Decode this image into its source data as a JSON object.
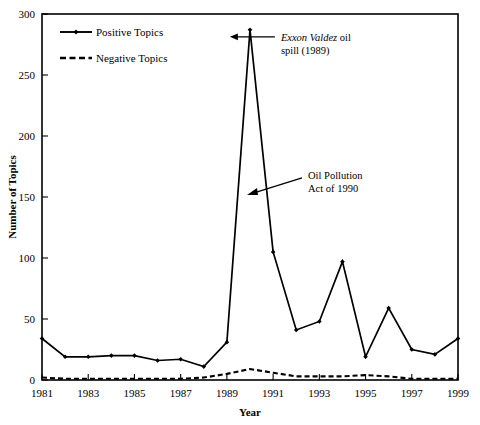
{
  "chart_data": {
    "type": "line",
    "title": "",
    "xlabel": "Year",
    "ylabel": "Number of Topics",
    "x": [
      1981,
      1982,
      1983,
      1984,
      1985,
      1986,
      1987,
      1988,
      1989,
      1990,
      1991,
      1992,
      1993,
      1994,
      1995,
      1996,
      1997,
      1998,
      1999
    ],
    "xlim": [
      1981,
      1999
    ],
    "ylim": [
      0,
      300
    ],
    "xticks": [
      1981,
      1983,
      1985,
      1987,
      1989,
      1991,
      1993,
      1995,
      1997,
      1999
    ],
    "xtick_labels": [
      "1981",
      "1983",
      "1985",
      "1987",
      "1989",
      "1991",
      "1993",
      "1995",
      "1997",
      "1999"
    ],
    "yticks": [
      0,
      50,
      100,
      150,
      200,
      250,
      300
    ],
    "ytick_labels": [
      "0",
      "50",
      "100",
      "150",
      "200",
      "250",
      "300"
    ],
    "grid": false,
    "legend_position": "top-left",
    "series": [
      {
        "name": "Positive Topics",
        "style": "solid",
        "marker": "diamond",
        "values": [
          34,
          19,
          19,
          20,
          20,
          16,
          17,
          11,
          31,
          287,
          105,
          41,
          48,
          97,
          19,
          59,
          25,
          21,
          34
        ]
      },
      {
        "name": "Negative Topics",
        "style": "dashed",
        "marker": "none",
        "values": [
          2,
          1,
          1,
          1,
          1,
          1,
          1,
          2,
          5,
          9,
          6,
          3,
          3,
          3,
          4,
          3,
          1,
          1,
          1
        ]
      }
    ],
    "annotations": [
      {
        "id": "exxon-valdez",
        "line1_italic": "Exxon Valdez",
        "line1_rest": " oil",
        "line2": "spill (1989)",
        "points_to_year": 1989,
        "points_to_value": 287
      },
      {
        "id": "oil-pollution-act",
        "line1": "Oil Pollution",
        "line2": "Act of 1990",
        "points_to_year": 1990,
        "points_to_value": 155
      }
    ]
  },
  "legend": {
    "items": [
      {
        "label": "Positive Topics",
        "style": "solid"
      },
      {
        "label": "Negative Topics",
        "style": "dashed"
      }
    ]
  },
  "colors": {
    "line": "#000000",
    "background": "#ffffff",
    "axis": "#000000"
  }
}
